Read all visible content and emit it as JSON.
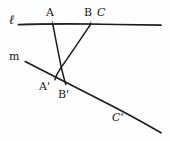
{
  "figure": {
    "kind": "hand-drawn-geometry-diagram",
    "ink_color": "#1a1a1a",
    "background_color": "#fefefe",
    "width": 170,
    "height": 141
  },
  "labels": {
    "line_l": "ℓ",
    "line_m": "m",
    "point_a": "A",
    "point_b": "B",
    "point_c": "C",
    "point_a_prime": "A'",
    "point_b_prime": "B'",
    "point_c_prime": "C'"
  },
  "geometry": {
    "line_l": {
      "name": "ℓ",
      "x1": 18,
      "y1": 24,
      "x2": 161,
      "y2": 25
    },
    "line_m": {
      "name": "m",
      "x1": 25,
      "y1": 62,
      "x2": 161,
      "y2": 133
    },
    "points_on_l": [
      {
        "label": "A",
        "x": 53,
        "y": 24
      },
      {
        "label": "B",
        "x": 90,
        "y": 24
      },
      {
        "label": "C",
        "x": 100,
        "y": 25
      }
    ],
    "points_on_m": [
      {
        "label": "A'",
        "x": 55,
        "y": 78
      },
      {
        "label": "B'",
        "x": 65,
        "y": 83
      },
      {
        "label": "C'",
        "x": 126,
        "y": 115
      }
    ],
    "transversals": [
      {
        "from": "A",
        "to": "B'",
        "x1": 53,
        "y1": 24,
        "x2": 66,
        "y2": 84
      },
      {
        "from": "B",
        "to": "A'",
        "x1": 90,
        "y1": 25,
        "x2": 55,
        "y2": 80
      }
    ],
    "crossing_point": {
      "x": 60,
      "y": 62
    }
  },
  "label_positions": {
    "line_l": {
      "x": 9,
      "y": 14
    },
    "line_m": {
      "x": 9,
      "y": 51
    },
    "point_a": {
      "x": 46,
      "y": 7
    },
    "point_b": {
      "x": 84,
      "y": 7
    },
    "point_c": {
      "x": 97,
      "y": 7
    },
    "point_a_prime": {
      "x": 39,
      "y": 81
    },
    "point_b_prime": {
      "x": 58,
      "y": 89
    },
    "point_c_prime": {
      "x": 112,
      "y": 112
    }
  }
}
